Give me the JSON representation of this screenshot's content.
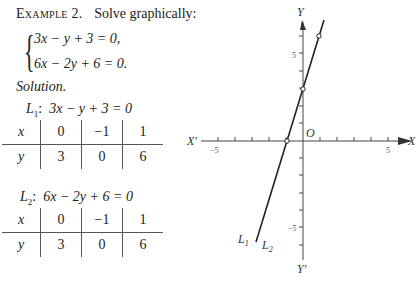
{
  "example": {
    "label": "Example 2.",
    "prompt": "Solve graphically:",
    "equations": [
      "3x − y + 3 = 0,",
      "6x − 2y + 6 = 0."
    ]
  },
  "solution_label": "Solution.",
  "tables": [
    {
      "line_label": "L",
      "line_sub": "1",
      "equation": "3x − y + 3 = 0",
      "x_header": "x",
      "y_header": "y",
      "x_values": [
        "0",
        "−1",
        "1"
      ],
      "y_values": [
        "3",
        "0",
        "6"
      ]
    },
    {
      "line_label": "L",
      "line_sub": "2",
      "equation": "6x − 2y + 6 = 0",
      "x_header": "x",
      "y_header": "y",
      "x_values": [
        "0",
        "−1",
        "1"
      ],
      "y_values": [
        "3",
        "0",
        "6"
      ]
    }
  ],
  "graph": {
    "y_axis_label": "Y",
    "y_axis_neg_label": "Y′",
    "x_axis_label": "X",
    "x_axis_neg_label": "X′",
    "origin_label": "O",
    "tick_labels": {
      "x_neg5": "−5",
      "x_pos5": "5",
      "y_pos5": "5",
      "y_neg5": "−5"
    },
    "line_label_1": "L",
    "line_label_1_sub": "1",
    "line_label_2": "L",
    "line_label_2_sub": "2",
    "plotted_points": [
      [
        0,
        3
      ],
      [
        -1,
        0
      ],
      [
        1,
        6
      ]
    ]
  }
}
